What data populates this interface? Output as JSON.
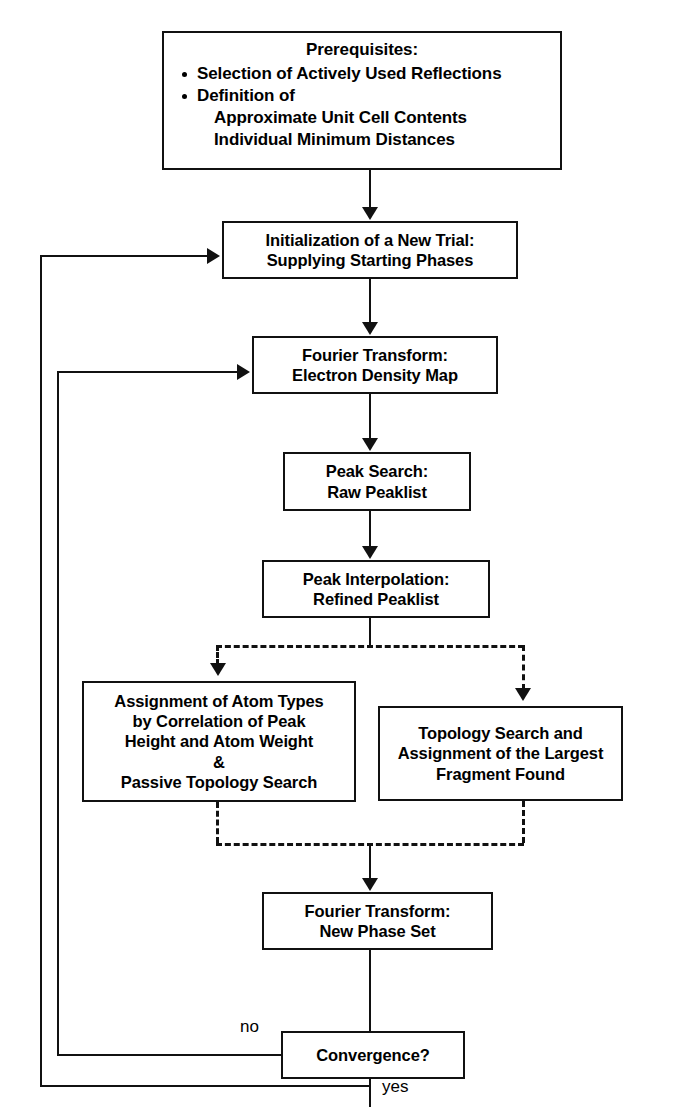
{
  "diagram": {
    "type": "flowchart",
    "background_color": "#ffffff",
    "line_color": "#111111",
    "text_color": "#000000"
  },
  "nodes": {
    "prerequisites": {
      "title": "Prerequisites:",
      "bullets": [
        "Selection of Actively Used Reflections",
        "Definition of"
      ],
      "sub_lines": [
        "Approximate Unit Cell Contents",
        "Individual Minimum Distances"
      ]
    },
    "initialization": {
      "line1": "Initialization of a New Trial:",
      "line2": "Supplying Starting Phases"
    },
    "fourier_density": {
      "line1": "Fourier Transform:",
      "line2": "Electron Density Map"
    },
    "peak_search": {
      "line1": "Peak Search:",
      "line2": "Raw Peaklist"
    },
    "peak_interpolation": {
      "line1": "Peak Interpolation:",
      "line2": "Refined Peaklist"
    },
    "atom_assignment": {
      "line1": "Assignment of Atom Types",
      "line2": "by Correlation of Peak",
      "line3": "Height and Atom Weight",
      "line4": "&",
      "line5": "Passive Topology Search"
    },
    "topology_search": {
      "line1": "Topology Search and",
      "line2": "Assignment of the Largest",
      "line3": "Fragment Found"
    },
    "fourier_phase": {
      "line1": "Fourier Transform:",
      "line2": "New Phase Set"
    },
    "convergence": {
      "line1": "Convergence?"
    }
  },
  "edge_labels": {
    "no": "no",
    "yes": "yes"
  }
}
